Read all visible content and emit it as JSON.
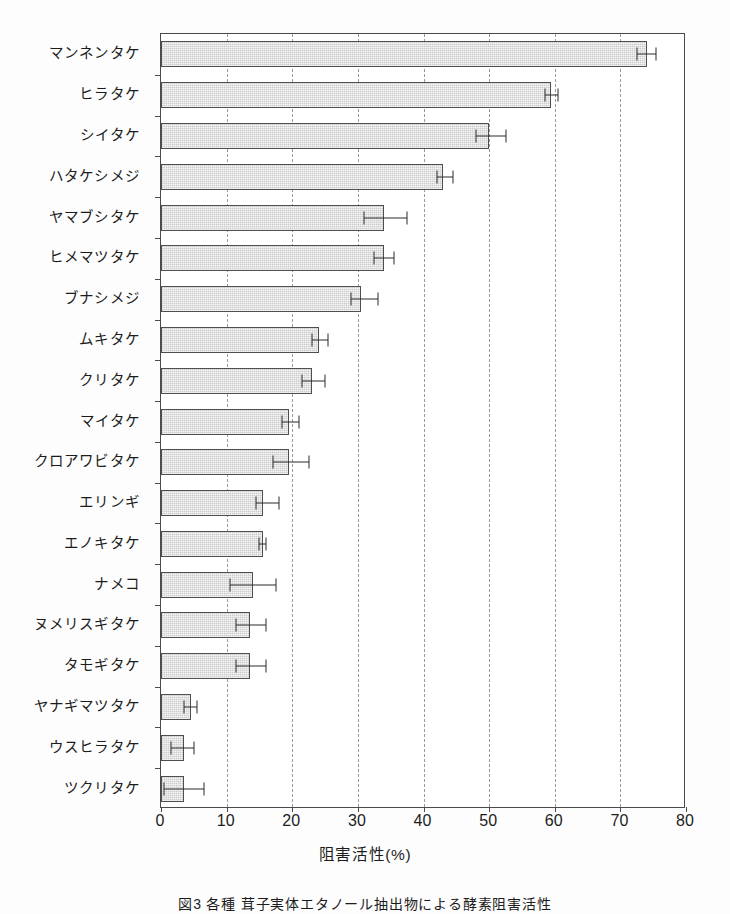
{
  "figure": {
    "caption": "図3 各種 茸子実体エタノール抽出物による酵素阻害活性"
  },
  "axes": {
    "x_title": "阻害活性(%)",
    "x_ticks": [
      0,
      10,
      20,
      30,
      40,
      50,
      60,
      70,
      80
    ],
    "x_min": 0,
    "x_max": 80,
    "grid": "vertical-dashed"
  },
  "colors": {
    "bar_fill": "#e3e3e3",
    "bar_edge": "#4f4f4f",
    "error_bar": "#2a2a2a",
    "grid": "#9a9a9a",
    "frame": "#4a4a4a",
    "background": "#ffffff"
  },
  "chart_data": {
    "type": "bar",
    "orientation": "horizontal",
    "title": "",
    "xlabel": "阻害活性(%)",
    "ylabel": "",
    "xlim": [
      0,
      80
    ],
    "grid": true,
    "legend": "none",
    "categories": [
      "マンネンタケ",
      "ヒラタケ",
      "シイタケ",
      "ハタケシメジ",
      "ヤマブシタケ",
      "ヒメマツタケ",
      "ブナシメジ",
      "ムキタケ",
      "クリタケ",
      "マイタケ",
      "クロアワビタケ",
      "エリンギ",
      "エノキタケ",
      "ナメコ",
      "ヌメリスギタケ",
      "タモギタケ",
      "ヤナギマツタケ",
      "ウスヒラタケ",
      "ツクリタケ"
    ],
    "values": [
      74.0,
      59.5,
      50.0,
      43.0,
      34.0,
      34.0,
      30.5,
      24.0,
      23.0,
      19.5,
      19.5,
      15.5,
      15.5,
      14.0,
      13.5,
      13.5,
      4.5,
      3.5,
      3.5
    ],
    "errors_low": [
      1.5,
      1.0,
      2.0,
      1.0,
      3.0,
      1.5,
      1.5,
      1.0,
      1.5,
      1.0,
      2.5,
      1.0,
      0.5,
      3.5,
      2.0,
      2.0,
      1.0,
      2.0,
      3.0
    ],
    "errors_high": [
      1.5,
      1.0,
      2.5,
      1.5,
      3.5,
      1.5,
      2.5,
      1.5,
      2.0,
      1.5,
      3.0,
      2.5,
      0.5,
      3.5,
      2.5,
      2.5,
      1.0,
      1.5,
      3.0
    ]
  }
}
